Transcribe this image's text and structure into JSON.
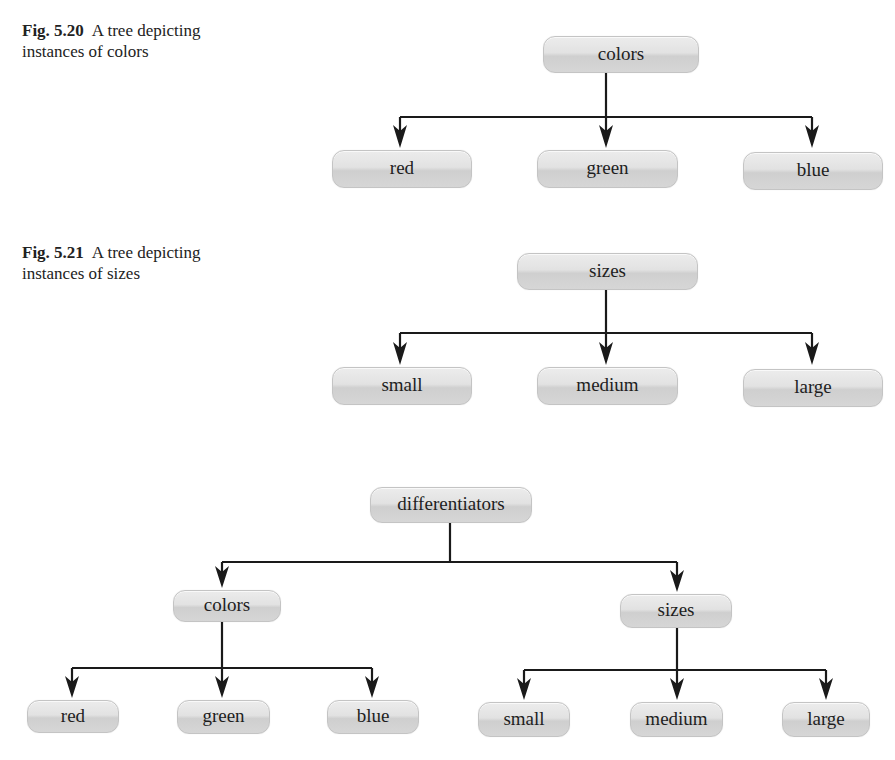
{
  "figures": [
    {
      "id": "fig-5-20",
      "caption": {
        "number": "Fig. 5.20",
        "line1": "A tree depicting",
        "line2": "instances of colors"
      },
      "root": "colors",
      "children": [
        "red",
        "green",
        "blue"
      ]
    },
    {
      "id": "fig-5-21",
      "caption": {
        "number": "Fig. 5.21",
        "line1": "A tree depicting",
        "line2": "instances of sizes"
      },
      "root": "sizes",
      "children": [
        "small",
        "medium",
        "large"
      ]
    },
    {
      "id": "fig-combined",
      "root": "differentiators",
      "children": [
        {
          "label": "colors",
          "children": [
            "red",
            "green",
            "blue"
          ]
        },
        {
          "label": "sizes",
          "children": [
            "small",
            "medium",
            "large"
          ]
        }
      ]
    }
  ],
  "colors": {
    "node_fill": "#dcdcdc",
    "node_border": "#c4c4c4",
    "line": "#1a1a1a",
    "text": "#1e1e1e"
  }
}
